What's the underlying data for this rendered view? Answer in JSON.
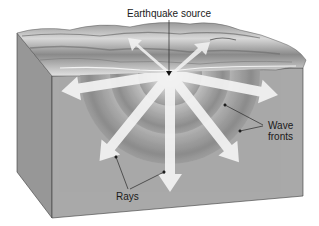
{
  "diagram": {
    "labels": {
      "source": "Earthquake source",
      "wave_fronts_line1": "Wave",
      "wave_fronts_line2": "fronts",
      "rays": "Rays"
    },
    "components": [
      {
        "id": "earth-block",
        "description": "3D cutaway block of crust with textured top surface"
      },
      {
        "id": "wave-fronts",
        "description": "Concentric hemispherical shells spreading from the source"
      },
      {
        "id": "rays",
        "description": "White arrows radiating outward perpendicular to wave fronts",
        "count": 7
      }
    ],
    "colors": {
      "front_face": "#a9a9a9",
      "side_face": "#979797",
      "shell_outer": "#8f8f8f",
      "shell_mid": "#b4b4b4",
      "shell_inner": "#9a9a9a",
      "ray": "#f2f2f2",
      "line": "#2a2a2a"
    }
  }
}
